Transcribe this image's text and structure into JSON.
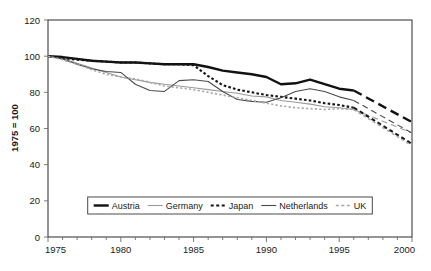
{
  "chart_data": {
    "type": "line",
    "title": "",
    "xlabel": "",
    "ylabel": "1975 = 100",
    "xlim": [
      1975,
      2000
    ],
    "ylim": [
      0,
      120
    ],
    "xticks": [
      1975,
      1980,
      1985,
      1990,
      1995,
      2000
    ],
    "yticks": [
      0,
      20,
      40,
      60,
      80,
      100,
      120
    ],
    "xtick_labels": [
      "1975",
      "1980",
      "1985",
      "1990",
      "1995",
      "2000"
    ],
    "ytick_labels": [
      "0",
      "20",
      "40",
      "60",
      "80",
      "100",
      "120"
    ],
    "minor_xtick_interval": 1,
    "grid": false,
    "legend_position": "bottom-center",
    "projection_note": "solid line = historical data to 1996, dashed segment = projection 1996-2000",
    "x": [
      1975,
      1976,
      1977,
      1978,
      1979,
      1980,
      1981,
      1982,
      1983,
      1984,
      1985,
      1986,
      1987,
      1988,
      1989,
      1990,
      1991,
      1992,
      1993,
      1994,
      1995,
      1996,
      2000
    ],
    "series": [
      {
        "name": "Austria",
        "color": "#111111",
        "style": "solid-thick",
        "width": 2.4,
        "projection_from": 1996,
        "values": [
          100,
          99.5,
          98.5,
          97.5,
          97,
          96.5,
          96.5,
          96,
          95.5,
          95.5,
          95.5,
          94,
          92,
          91,
          90,
          88.5,
          84.5,
          85,
          87,
          84.5,
          82,
          81,
          63.5
        ]
      },
      {
        "name": "Germany",
        "color": "#9a9a9a",
        "style": "solid-thin",
        "width": 1.1,
        "projection_from": 1996,
        "values": [
          100,
          98.5,
          96,
          93.5,
          91,
          88.5,
          87,
          85.5,
          84.5,
          83.5,
          82.5,
          81.5,
          80.5,
          79.5,
          78,
          77.5,
          75.5,
          74.5,
          73.5,
          72,
          71.5,
          70.5,
          57.5
        ]
      },
      {
        "name": "Japan",
        "color": "#151515",
        "style": "dotted",
        "width": 2.1,
        "projection_from": 1996,
        "values": [
          100,
          99,
          98,
          97.5,
          97,
          96.5,
          96.5,
          96,
          95.5,
          95.5,
          95,
          89,
          84,
          81.5,
          80,
          78.5,
          77.5,
          76.5,
          75.5,
          74,
          73,
          71.5,
          51.5
        ]
      },
      {
        "name": "Netherlands",
        "color": "#4a4a4a",
        "style": "solid-thin",
        "width": 1.1,
        "projection_from": 1996,
        "values": [
          100,
          98.5,
          95.5,
          93,
          91.5,
          91,
          84.5,
          81,
          80.5,
          86.5,
          87,
          86,
          80.5,
          76,
          75,
          74.5,
          77,
          80.5,
          82,
          80.5,
          77.5,
          75.5,
          57.5
        ]
      },
      {
        "name": "UK",
        "color": "#a8a8a8",
        "style": "dotted",
        "width": 1.6,
        "projection_from": 1996,
        "values": [
          100,
          98,
          95.5,
          92.5,
          90,
          88.5,
          87.5,
          85.5,
          83.5,
          82.5,
          81.5,
          80,
          78.5,
          77,
          75.5,
          74,
          72.5,
          71.5,
          71,
          70.5,
          71,
          70.5,
          50.5
        ]
      }
    ]
  },
  "legend": {
    "items": [
      {
        "label": "Austria"
      },
      {
        "label": "Germany"
      },
      {
        "label": "Japan"
      },
      {
        "label": "Netherlands"
      },
      {
        "label": "UK"
      }
    ]
  }
}
